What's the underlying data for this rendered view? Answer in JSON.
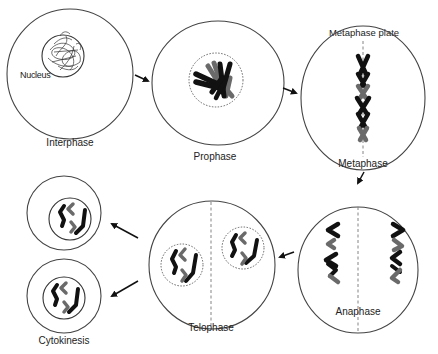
{
  "diagram": {
    "type": "cell-division-cycle",
    "stages": [
      {
        "id": "interphase",
        "label": "Interphase",
        "callout": "Nucleus"
      },
      {
        "id": "prophase",
        "label": "Prophase"
      },
      {
        "id": "metaphase",
        "label": "Metaphase",
        "callout": "Metaphase plate"
      },
      {
        "id": "anaphase",
        "label": "Anaphase"
      },
      {
        "id": "telophase",
        "label": "Telophase"
      },
      {
        "id": "cytokinesis",
        "label": "Cytokinesis"
      }
    ],
    "flow": [
      {
        "from": "interphase",
        "to": "prophase"
      },
      {
        "from": "prophase",
        "to": "metaphase"
      },
      {
        "from": "metaphase",
        "to": "anaphase"
      },
      {
        "from": "anaphase",
        "to": "telophase"
      },
      {
        "from": "telophase",
        "to": "cytokinesis"
      }
    ],
    "colors": {
      "chromosome_dark": "#111111",
      "chromosome_light": "#6a6a6a",
      "outline": "#444444"
    }
  }
}
